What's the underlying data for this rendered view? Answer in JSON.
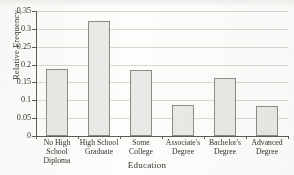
{
  "chart_data": {
    "type": "bar",
    "title": "",
    "xlabel": "Education",
    "ylabel": "Relative Frequency",
    "categories": [
      "No High School Diploma",
      "High School Graduate",
      "Some College",
      "Associate's Degree",
      "Bachelor's Degree",
      "Advanced Degree"
    ],
    "category_lines": [
      [
        "No High",
        "School",
        "Diploma"
      ],
      [
        "High School",
        "Graduate"
      ],
      [
        "Some",
        "College"
      ],
      [
        "Associate's",
        "Degree"
      ],
      [
        "Bachelor's",
        "Degree"
      ],
      [
        "Advanced",
        "Degree"
      ]
    ],
    "values": [
      0.187,
      0.321,
      0.185,
      0.086,
      0.163,
      0.083
    ],
    "ylim": [
      0,
      0.35
    ],
    "yticks": [
      0,
      0.05,
      0.1,
      0.15,
      0.2,
      0.25,
      0.3,
      0.35
    ],
    "ytick_labels": [
      "0",
      "0.05",
      "0.1",
      "0.15",
      "0.2",
      "0.25",
      "0.3",
      "0.35"
    ],
    "grid": true,
    "grid_axis": "y",
    "legend": "none",
    "bar_fill_color": "#e9e9e7",
    "bar_edge_color": "#8d8d88",
    "grid_color": "#d9d9d4",
    "axis_color": "#5d5d58",
    "background_color": "#fdfdfc"
  },
  "figure": {
    "clipped_title_text": "",
    "axis_title_x": "Education",
    "axis_title_y": "Relative Frequency"
  }
}
